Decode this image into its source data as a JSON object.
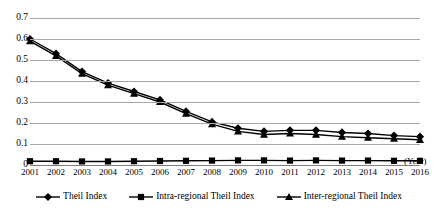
{
  "chart_data": {
    "type": "line",
    "title": "",
    "xlabel": "(Year)",
    "ylabel": "",
    "ylim": [
      0,
      0.7
    ],
    "ytick_labels": [
      "0",
      "0.1",
      "0.2",
      "0.3",
      "0.4",
      "0.5",
      "0.6",
      "0.7"
    ],
    "ytick_values": [
      0,
      0.1,
      0.2,
      0.3,
      0.4,
      0.5,
      0.6,
      0.7
    ],
    "grid": true,
    "legend_position": "bottom",
    "categories": [
      "2001",
      "2002",
      "2003",
      "2004",
      "2005",
      "2006",
      "2007",
      "2008",
      "2009",
      "2010",
      "2011",
      "2012",
      "2013",
      "2014",
      "2015",
      "2016"
    ],
    "x": [
      2001,
      2002,
      2003,
      2004,
      2005,
      2006,
      2007,
      2008,
      2009,
      2010,
      2011,
      2012,
      2013,
      2014,
      2015,
      2016
    ],
    "series": [
      {
        "name": "Theil Index",
        "marker": "diamond",
        "color": "#000000",
        "values": [
          0.6,
          0.53,
          0.445,
          0.39,
          0.35,
          0.31,
          0.255,
          0.205,
          0.175,
          0.16,
          0.165,
          0.165,
          0.155,
          0.15,
          0.14,
          0.135
        ]
      },
      {
        "name": "Intra-regional Theil Index",
        "marker": "square",
        "color": "#000000",
        "values": [
          0.018,
          0.018,
          0.017,
          0.017,
          0.018,
          0.019,
          0.02,
          0.021,
          0.022,
          0.022,
          0.021,
          0.022,
          0.021,
          0.021,
          0.02,
          0.02
        ]
      },
      {
        "name": "Inter-regional Theil Index",
        "marker": "triangle",
        "color": "#000000",
        "values": [
          0.59,
          0.52,
          0.435,
          0.38,
          0.34,
          0.3,
          0.245,
          0.195,
          0.16,
          0.145,
          0.15,
          0.145,
          0.135,
          0.13,
          0.125,
          0.12
        ]
      }
    ]
  },
  "axis": {
    "x_title": "(Year)"
  },
  "legend": {
    "items": [
      {
        "label": "Theil Index",
        "marker": "diamond"
      },
      {
        "label": "Intra-regional Theil Index",
        "marker": "square"
      },
      {
        "label": "Inter-regional Theil Index",
        "marker": "triangle"
      }
    ]
  },
  "colors": {
    "series": "#000000",
    "gridline": "#a6a6a6",
    "axis": "#808080",
    "background": "#ffffff"
  }
}
